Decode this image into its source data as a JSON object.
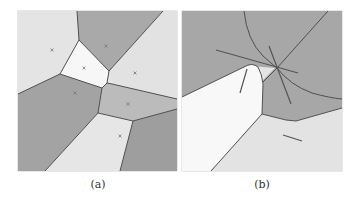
{
  "figure": {
    "panels": [
      {
        "id": "a",
        "caption": "(a)",
        "description": "Voronoi diagram of 8 sites with grey-shaded cells",
        "sites": 8
      },
      {
        "id": "b",
        "caption": "(b)",
        "description": "Voronoi-like partition of line-segment sites with curved boundaries",
        "segments": 5
      }
    ],
    "colors": {
      "light": "#e8e8e8",
      "mid": "#b5b5b5",
      "dark": "#9a9a9a",
      "white": "#fafafa",
      "edge": "#444444"
    }
  }
}
